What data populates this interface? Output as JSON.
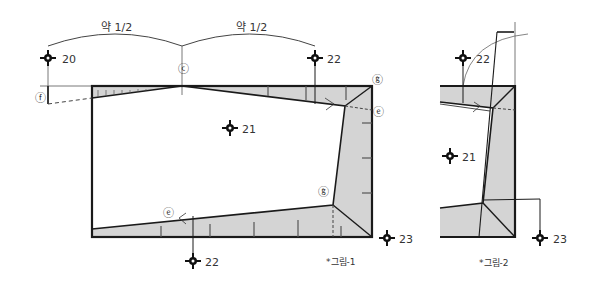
{
  "figure1": {
    "caption": "*그림-1",
    "span_labels": [
      "약 1/2",
      "약 1/2"
    ],
    "point_labels": {
      "c": "ⓒ",
      "f": "ⓕ",
      "g_top": "ⓖ",
      "e_right": "ⓔ",
      "g_inner": "ⓖ",
      "e_bottom": "ⓔ"
    },
    "markers": [
      {
        "id": "m20",
        "label": "20"
      },
      {
        "id": "m22_top",
        "label": "22"
      },
      {
        "id": "m21",
        "label": "21"
      },
      {
        "id": "m22_bottom",
        "label": "22"
      },
      {
        "id": "m23",
        "label": "23"
      }
    ]
  },
  "figure2": {
    "caption": "*그림-2",
    "markers": [
      {
        "id": "m22",
        "label": "22"
      },
      {
        "id": "m21",
        "label": "21"
      },
      {
        "id": "m23",
        "label": "23"
      }
    ]
  },
  "colors": {
    "line": "#1a1a1a",
    "shade": "#d4d4d4",
    "text": "#333333"
  }
}
